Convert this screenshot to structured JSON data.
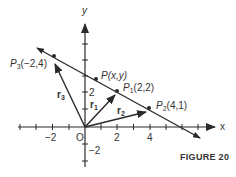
{
  "figure": {
    "caption": "FIGURE 20",
    "axes": {
      "x_label": "x",
      "y_label": "y",
      "origin_label": "O",
      "x_tick_labels": [
        "−2",
        "2",
        "4"
      ],
      "y_tick_labels": [
        "2",
        "−2"
      ]
    },
    "points": [
      {
        "name": "P",
        "sub": "3",
        "coords": "(−2,4)"
      },
      {
        "name": "P",
        "sub": "",
        "coords": "(x,y)"
      },
      {
        "name": "P",
        "sub": "1",
        "coords": "(2,2)"
      },
      {
        "name": "P",
        "sub": "2",
        "coords": "(4,1)"
      }
    ],
    "vectors": [
      {
        "name": "r",
        "sub": "3"
      },
      {
        "name": "r",
        "sub": "1"
      },
      {
        "name": "r",
        "sub": "2"
      }
    ],
    "colors": {
      "ink": "#2a2a2a",
      "background": "#ffffff"
    }
  }
}
